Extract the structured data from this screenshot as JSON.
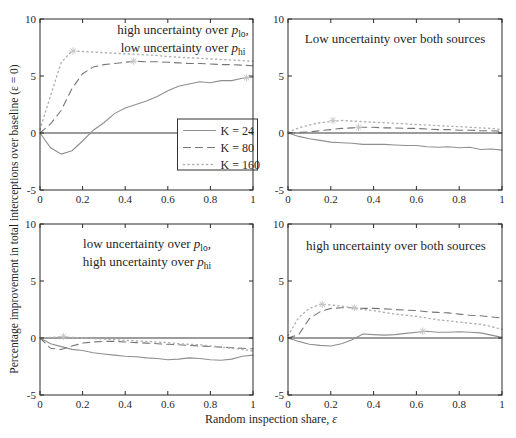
{
  "figure": {
    "y_axis_label": "Percentage improvement in total interceptions over baseline (ε = 0)",
    "x_axis_label_pre": "Random inspection share, ",
    "x_axis_label_symbol": "ε",
    "colors": {
      "solid": "#8f8f8f",
      "dashed": "#767676",
      "dotted": "#b0b0b0",
      "marker": "#c6c6c6",
      "axis_box": "#2b2b2b",
      "zero_line": "#3a3a3a",
      "text": "#1f1f1f",
      "background": "#ffffff"
    },
    "legend": {
      "panel": "top-left",
      "location": "lower-right",
      "entries": [
        {
          "label": "K = 24",
          "style": "solid"
        },
        {
          "label": "K = 80",
          "style": "dashed"
        },
        {
          "label": "K = 160",
          "style": "dotted"
        }
      ]
    }
  },
  "chart_data": [
    {
      "type": "line",
      "panel": "top-left",
      "title_lines": [
        {
          "pre": "high uncertainty over ",
          "it": "p",
          "sub": "lo",
          "post": ","
        },
        {
          "pre": "low uncertainty over ",
          "it": "p",
          "sub": "hi",
          "post": ""
        }
      ],
      "xlim": [
        0,
        1
      ],
      "ylim": [
        -5,
        10
      ],
      "x_ticks": [
        0,
        0.2,
        0.4,
        0.6,
        0.8,
        1
      ],
      "y_ticks": [
        -5,
        0,
        5,
        10
      ],
      "grid": false,
      "x": [
        0,
        0.05,
        0.1,
        0.15,
        0.2,
        0.25,
        0.3,
        0.35,
        0.4,
        0.45,
        0.5,
        0.55,
        0.6,
        0.65,
        0.7,
        0.75,
        0.8,
        0.85,
        0.9,
        0.95,
        1
      ],
      "series": [
        {
          "name": "K = 24",
          "style": "solid",
          "values": [
            0,
            -1.3,
            -1.85,
            -1.55,
            -0.7,
            0.25,
            0.9,
            1.7,
            2.2,
            2.5,
            2.8,
            3.2,
            3.7,
            4.1,
            4.3,
            4.5,
            4.4,
            4.6,
            4.6,
            4.8,
            4.9
          ]
        },
        {
          "name": "K = 80",
          "style": "dashed",
          "values": [
            0,
            0.8,
            2.0,
            3.9,
            5.2,
            5.8,
            6.0,
            6.1,
            6.2,
            6.3,
            6.25,
            6.25,
            6.2,
            6.15,
            6.1,
            6.1,
            6.05,
            6.0,
            6.0,
            5.95,
            5.9
          ]
        },
        {
          "name": "K = 160",
          "style": "dotted",
          "values": [
            0.3,
            3.3,
            6.2,
            7.2,
            7.15,
            7.1,
            7.05,
            7.0,
            6.95,
            6.9,
            6.85,
            6.8,
            6.7,
            6.65,
            6.6,
            6.55,
            6.5,
            6.45,
            6.4,
            6.35,
            6.3
          ]
        }
      ],
      "peak_markers": [
        {
          "series": "K = 160",
          "x": 0.155,
          "y": 7.2
        },
        {
          "series": "K = 80",
          "x": 0.44,
          "y": 6.3
        },
        {
          "series": "K = 24",
          "x": 0.97,
          "y": 4.85
        }
      ]
    },
    {
      "type": "line",
      "panel": "top-right",
      "title_lines": [
        {
          "pre": "Low uncertainty over both sources",
          "it": "",
          "sub": "",
          "post": ""
        }
      ],
      "xlim": [
        0,
        1
      ],
      "ylim": [
        -5,
        10
      ],
      "x_ticks": [
        0,
        0.2,
        0.4,
        0.6,
        0.8,
        1
      ],
      "y_ticks": [
        -5,
        0,
        5,
        10
      ],
      "grid": false,
      "x": [
        0,
        0.05,
        0.1,
        0.15,
        0.2,
        0.25,
        0.3,
        0.35,
        0.4,
        0.45,
        0.5,
        0.55,
        0.6,
        0.65,
        0.7,
        0.75,
        0.8,
        0.85,
        0.9,
        0.95,
        1
      ],
      "series": [
        {
          "name": "K = 24",
          "style": "solid",
          "values": [
            0,
            -0.3,
            -0.5,
            -0.65,
            -0.8,
            -0.85,
            -0.9,
            -1.0,
            -1.0,
            -1.0,
            -1.05,
            -1.1,
            -1.1,
            -1.2,
            -1.25,
            -1.2,
            -1.3,
            -1.25,
            -1.45,
            -1.4,
            -1.5
          ]
        },
        {
          "name": "K = 80",
          "style": "dashed",
          "values": [
            0,
            0.05,
            0.1,
            0.2,
            0.3,
            0.4,
            0.45,
            0.5,
            0.5,
            0.45,
            0.45,
            0.4,
            0.4,
            0.35,
            0.3,
            0.3,
            0.25,
            0.25,
            0.2,
            0.2,
            0.15
          ]
        },
        {
          "name": "K = 160",
          "style": "dotted",
          "values": [
            0.05,
            0.45,
            0.7,
            0.9,
            1.0,
            1.1,
            1.05,
            1.0,
            0.95,
            0.9,
            0.85,
            0.8,
            0.75,
            0.7,
            0.65,
            0.6,
            0.55,
            0.5,
            0.45,
            0.4,
            0.3
          ]
        }
      ],
      "peak_markers": [
        {
          "series": "K = 160",
          "x": 0.21,
          "y": 1.1
        },
        {
          "series": "K = 80",
          "x": 0.33,
          "y": 0.5
        }
      ]
    },
    {
      "type": "line",
      "panel": "bottom-left",
      "title_lines": [
        {
          "pre": "low uncertainty over ",
          "it": "p",
          "sub": "lo",
          "post": ","
        },
        {
          "pre": "high uncertainty over ",
          "it": "p",
          "sub": "hi",
          "post": ""
        }
      ],
      "xlim": [
        0,
        1
      ],
      "ylim": [
        -5,
        10
      ],
      "x_ticks": [
        0,
        0.2,
        0.4,
        0.6,
        0.8,
        1
      ],
      "y_ticks": [
        -5,
        0,
        5,
        10
      ],
      "grid": false,
      "x": [
        0,
        0.05,
        0.1,
        0.15,
        0.2,
        0.25,
        0.3,
        0.35,
        0.4,
        0.45,
        0.5,
        0.55,
        0.6,
        0.65,
        0.7,
        0.75,
        0.8,
        0.85,
        0.9,
        0.95,
        1
      ],
      "series": [
        {
          "name": "K = 24",
          "style": "solid",
          "values": [
            0,
            -0.5,
            -0.75,
            -1.0,
            -1.1,
            -1.3,
            -1.4,
            -1.5,
            -1.6,
            -1.65,
            -1.75,
            -1.8,
            -1.9,
            -1.85,
            -1.75,
            -1.8,
            -1.9,
            -1.95,
            -1.85,
            -1.6,
            -1.5
          ]
        },
        {
          "name": "K = 80",
          "style": "dashed",
          "values": [
            0,
            -0.9,
            -1.0,
            -0.7,
            -0.45,
            -0.35,
            -0.3,
            -0.3,
            -0.35,
            -0.4,
            -0.45,
            -0.5,
            -0.55,
            -0.6,
            -0.65,
            -0.7,
            -0.75,
            -0.8,
            -0.85,
            -0.9,
            -0.95
          ]
        },
        {
          "name": "K = 160",
          "style": "dotted",
          "values": [
            0,
            0.05,
            0.1,
            0.05,
            0,
            -0.05,
            -0.1,
            -0.15,
            -0.2,
            -0.25,
            -0.3,
            -0.35,
            -0.4,
            -0.5,
            -0.55,
            -0.6,
            -0.7,
            -0.8,
            -0.9,
            -1.0,
            -1.15
          ]
        }
      ],
      "peak_markers": [
        {
          "series": "K = 160",
          "x": 0.11,
          "y": 0.12
        }
      ]
    },
    {
      "type": "line",
      "panel": "bottom-right",
      "title_lines": [
        {
          "pre": "high uncertainty over both sources",
          "it": "",
          "sub": "",
          "post": ""
        }
      ],
      "xlim": [
        0,
        1
      ],
      "ylim": [
        -5,
        10
      ],
      "x_ticks": [
        0,
        0.2,
        0.4,
        0.6,
        0.8,
        1
      ],
      "y_ticks": [
        -5,
        0,
        5,
        10
      ],
      "grid": false,
      "x": [
        0,
        0.05,
        0.1,
        0.15,
        0.2,
        0.25,
        0.3,
        0.35,
        0.4,
        0.45,
        0.5,
        0.55,
        0.6,
        0.65,
        0.7,
        0.75,
        0.8,
        0.85,
        0.9,
        0.95,
        1
      ],
      "series": [
        {
          "name": "K = 24",
          "style": "solid",
          "values": [
            0,
            -0.3,
            -0.55,
            -0.65,
            -0.7,
            -0.5,
            -0.15,
            0.35,
            0.3,
            0.25,
            0.3,
            0.4,
            0.5,
            0.6,
            0.5,
            0.5,
            0.55,
            0.5,
            0.45,
            0.25,
            0.05
          ]
        },
        {
          "name": "K = 80",
          "style": "dashed",
          "values": [
            0,
            0.3,
            1.7,
            2.3,
            2.6,
            2.65,
            2.65,
            2.6,
            2.6,
            2.55,
            2.5,
            2.45,
            2.4,
            2.3,
            2.25,
            2.2,
            2.1,
            2.0,
            1.95,
            1.85,
            1.75
          ]
        },
        {
          "name": "K = 160",
          "style": "dotted",
          "values": [
            0.2,
            1.8,
            2.6,
            2.95,
            2.9,
            2.8,
            2.65,
            2.5,
            2.4,
            2.25,
            2.1,
            2.0,
            1.9,
            1.75,
            1.6,
            1.5,
            1.4,
            1.3,
            1.2,
            1.0,
            0.75
          ]
        }
      ],
      "peak_markers": [
        {
          "series": "K = 160",
          "x": 0.16,
          "y": 2.95
        },
        {
          "series": "K = 80",
          "x": 0.31,
          "y": 2.65
        },
        {
          "series": "K = 24",
          "x": 0.63,
          "y": 0.6
        }
      ]
    }
  ]
}
